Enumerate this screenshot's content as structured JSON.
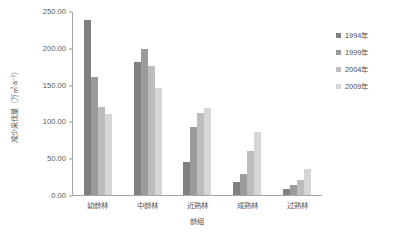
{
  "chart_data": {
    "type": "bar",
    "title": "",
    "xlabel": "龄组",
    "ylabel": "减少采伐量（万㎥·a⁻¹）",
    "categories": [
      "幼龄林",
      "中龄林",
      "近熟林",
      "成熟林",
      "过熟林"
    ],
    "series": [
      {
        "name": "1994年",
        "color": "#808080",
        "values": [
          238,
          181,
          45,
          18,
          8
        ]
      },
      {
        "name": "1999年",
        "color": "#9b9b9b",
        "values": [
          160,
          198,
          93,
          28,
          13
        ]
      },
      {
        "name": "2004年",
        "color": "#bdbdbd",
        "values": [
          120,
          175,
          112,
          60,
          20
        ]
      },
      {
        "name": "2009年",
        "color": "#d6d6d6",
        "values": [
          110,
          145,
          118,
          85,
          35
        ]
      }
    ],
    "ylim": [
      0,
      250
    ],
    "yticks": [
      "0.00",
      "50.00",
      "100.00",
      "150.00",
      "200.00",
      "250.00"
    ],
    "ytick_values": [
      0,
      50,
      100,
      150,
      200,
      250
    ],
    "grid": false,
    "legend_position": "right"
  },
  "axis_colors": {
    "axis_line": "#a6a6a6",
    "tick_text": "#595959",
    "label_text": "#555555"
  }
}
